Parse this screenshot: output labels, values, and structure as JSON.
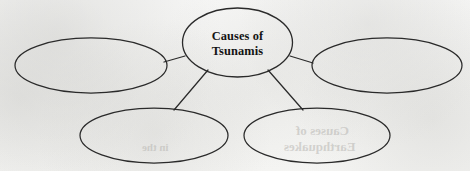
{
  "document": {
    "type": "concept-map",
    "title": "Causes of Tsunamis",
    "paper_color": "#f5f5f3",
    "ink_color": "#2a2a2a",
    "text_color": "#141414"
  },
  "diagram": {
    "center_node": {
      "id": "center",
      "line1": "Causes of",
      "line2": "Tsunamis",
      "cx": 237.5,
      "cy": 42.5,
      "rx": 55,
      "ry": 34.5,
      "filled": false
    },
    "branch_nodes": [
      {
        "id": "left",
        "label": "",
        "cx": 91,
        "cy": 65.5,
        "rx": 76,
        "ry": 27.5
      },
      {
        "id": "right",
        "label": "",
        "cx": 387,
        "cy": 65.5,
        "rx": 75,
        "ry": 27.5
      },
      {
        "id": "bottom-left",
        "label": "",
        "cx": 154,
        "cy": 135.5,
        "rx": 74,
        "ry": 27.5
      },
      {
        "id": "bottom-right",
        "label": "",
        "cx": 317,
        "cy": 135.5,
        "rx": 73,
        "ry": 27.5
      }
    ],
    "connectors": [
      {
        "from": "center",
        "to": "left",
        "x1": 185,
        "y1": 56,
        "x2": 164,
        "y2": 62
      },
      {
        "from": "center",
        "to": "right",
        "x1": 290,
        "y1": 56,
        "x2": 313,
        "y2": 63
      },
      {
        "from": "center",
        "to": "bottom-left",
        "x1": 208,
        "y1": 70,
        "x2": 174,
        "y2": 110
      },
      {
        "from": "center",
        "to": "bottom-right",
        "x1": 268,
        "y1": 70,
        "x2": 303,
        "y2": 110
      }
    ],
    "stroke_width": 1.25
  },
  "bleedthrough": [
    {
      "text": "Causes of",
      "x": 296,
      "y": 123,
      "size": 13
    },
    {
      "text": "Earthquakes",
      "x": 284,
      "y": 139,
      "size": 13
    },
    {
      "text": "in the",
      "x": 142,
      "y": 141,
      "size": 11
    }
  ]
}
